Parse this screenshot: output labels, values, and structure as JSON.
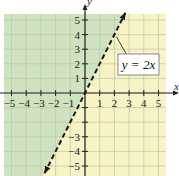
{
  "chart_data": {
    "type": "line",
    "title": "",
    "xlabel": "x",
    "ylabel": "y",
    "xlim": [
      -5.5,
      5.5
    ],
    "ylim": [
      -5.5,
      5.5
    ],
    "grid": true,
    "x_ticks": [
      "-5",
      "-4",
      "-3",
      "-2",
      "-1",
      "1",
      "2",
      "3",
      "4",
      "5"
    ],
    "y_ticks": [
      "5",
      "4",
      "3",
      "2",
      "1",
      "-3",
      "-4",
      "-5"
    ],
    "series": [
      {
        "name": "y = 2x",
        "equation": "y = 2x",
        "style": "dashed",
        "arrows": "both",
        "x": [
          -2.75,
          2.75
        ],
        "y": [
          -5.5,
          5.5
        ]
      }
    ],
    "shaded_regions": [
      {
        "name": "above line (y > 2x)",
        "color": "#cfe3c0"
      },
      {
        "name": "below line (y < 2x)",
        "color": "#f7f3c4"
      }
    ],
    "annotations": [
      {
        "text": "y = 2x",
        "points_to": [
          2,
          4
        ]
      }
    ],
    "colors": {
      "left_region": "#cfe3c0",
      "right_region": "#f7f3c4",
      "grid": "#b8c9a8",
      "line": "#1a1a1a",
      "axis": "#222222"
    }
  },
  "labels": {
    "equation": "y = 2x",
    "x_axis": "x",
    "y_axis": "y"
  }
}
